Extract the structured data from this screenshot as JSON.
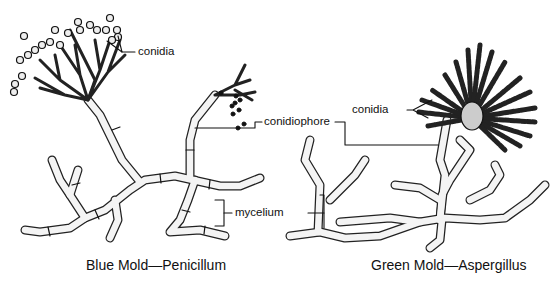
{
  "diagram": {
    "panels": [
      {
        "caption": "Blue Mold—Penicillum",
        "labels": {
          "conidia": "conidia",
          "conidiophore": "conidiophore",
          "mycelium": "mycelium"
        }
      },
      {
        "caption": "Green Mold—Aspergillus",
        "labels": {
          "conidia": "conidia"
        }
      }
    ],
    "shared_labels": {
      "conidiophore": "conidiophore",
      "mycelium": "mycelium"
    },
    "colors": {
      "ink": "#111111",
      "background": "#ffffff",
      "hypha_fill": "#f2f2f2"
    }
  }
}
